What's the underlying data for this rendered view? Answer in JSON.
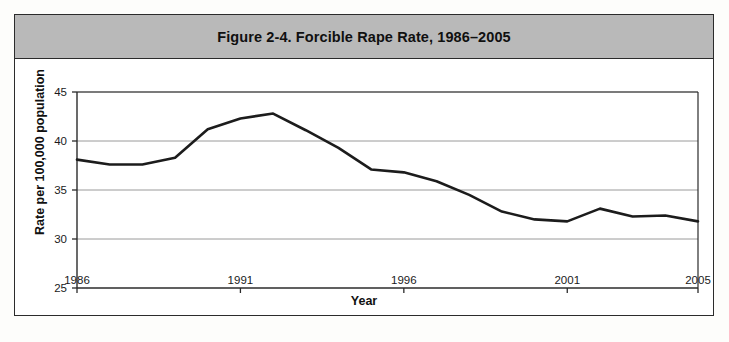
{
  "figure": {
    "title": "Figure 2-4. Forcible Rape Rate, 1986–2005",
    "frame_color": "#2b2b2b",
    "title_band_color": "#b9b9b9",
    "background_color": "#ffffff"
  },
  "chart_data": {
    "type": "line",
    "title": "Figure 2-4. Forcible Rape Rate, 1986–2005",
    "subtitle": "",
    "xlabel": "Year",
    "ylabel": "Rate per 100,000 population",
    "xlim": [
      1986,
      2005
    ],
    "ylim": [
      25,
      45
    ],
    "ytick_labels": [
      "25",
      "30",
      "35",
      "40",
      "45"
    ],
    "yticks": [
      25,
      30,
      35,
      40,
      45
    ],
    "xtick_labels": [
      "1986",
      "1991",
      "1996",
      "2001",
      "2005"
    ],
    "xticks": [
      1986,
      1991,
      1996,
      2001,
      2005
    ],
    "grid": true,
    "grid_axis": "y",
    "grid_color": "#9a9a9a",
    "legend": false,
    "legend_position": "none",
    "line_color": "#1c1c1c",
    "line_width": 2.6,
    "markers": false,
    "x": [
      1986,
      1987,
      1988,
      1989,
      1990,
      1991,
      1992,
      1993,
      1994,
      1995,
      1996,
      1997,
      1998,
      1999,
      2000,
      2001,
      2002,
      2003,
      2004,
      2005
    ],
    "values": [
      38.1,
      37.6,
      37.6,
      38.3,
      41.2,
      42.3,
      42.8,
      41.1,
      39.3,
      37.1,
      36.8,
      35.9,
      34.5,
      32.8,
      32.0,
      31.8,
      33.1,
      32.3,
      32.4,
      31.8
    ],
    "series": [
      {
        "name": "Forcible rape rate",
        "values": [
          38.1,
          37.6,
          37.6,
          38.3,
          41.2,
          42.3,
          42.8,
          41.1,
          39.3,
          37.1,
          36.8,
          35.9,
          34.5,
          32.8,
          32.0,
          31.8,
          33.1,
          32.3,
          32.4,
          31.8
        ]
      }
    ],
    "annotations": []
  }
}
